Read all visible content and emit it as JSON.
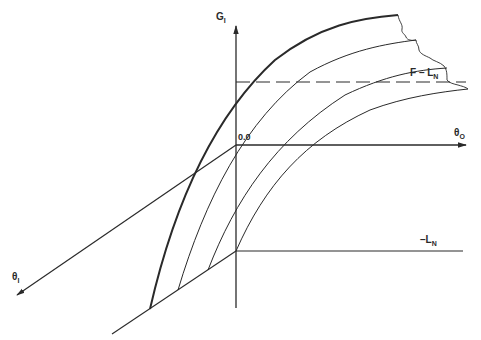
{
  "diagram": {
    "axes": {
      "vertical": {
        "label_main": "G",
        "label_sub": "I"
      },
      "horizontal": {
        "label_main": "θ",
        "label_sub": "O"
      },
      "oblique": {
        "label_main": "θ",
        "label_sub": "I"
      }
    },
    "origin_label": "0.0",
    "dashed_line_label": {
      "main": "F – L",
      "sub": "N"
    },
    "lower_line_label": {
      "main": "–L",
      "sub": "N"
    },
    "colors": {
      "line": "#2a2a2a",
      "background": "#ffffff"
    },
    "curves_count": 4
  }
}
